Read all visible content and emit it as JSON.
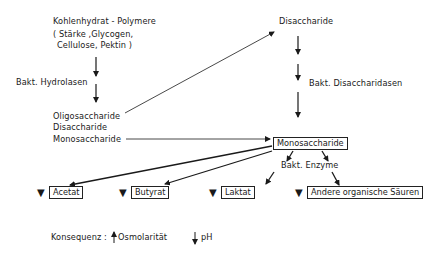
{
  "diagram": {
    "title_source": {
      "line1": "Kohlenhydrat - Polymere",
      "line2": "( Stärke ,Glycogen,",
      "line3": "Cellulose,  Pektin )"
    },
    "step1_label": "Bakt. Hydrolasen",
    "intermediates": {
      "line1": "Oligosaccharide",
      "line2": "Disaccharide",
      "line3": "Monosaccharide"
    },
    "disaccharide_node": "Disaccharide",
    "step2_label": "Bakt. Disaccharidasen",
    "monosaccharide_box": "Monosaccharide",
    "enzymes_label": "Bakt. Enzyme",
    "products": [
      {
        "label": "Acetat",
        "marker": "▼"
      },
      {
        "label": "Butyrat",
        "marker": "▼"
      },
      {
        "label": "Laktat",
        "marker": "▼"
      },
      {
        "label": "Andere organische Säuren",
        "marker": "▼"
      }
    ],
    "consequence": {
      "label": "Konsequenz :",
      "item1": "Osmolarität",
      "item1_direction": "up",
      "item2": "pH",
      "item2_direction": "down"
    }
  }
}
